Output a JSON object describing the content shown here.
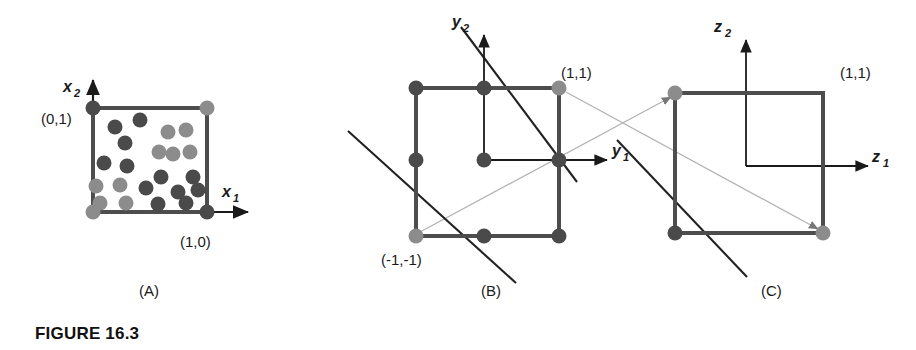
{
  "figure": {
    "caption": "FIGURE 16.3",
    "background_color": "#ffffff",
    "ink_color": "#1a1a1a",
    "square_color": "#4d4d4d",
    "dot_dark_color": "#4a4a4a",
    "dot_light_color": "#8c8c8c",
    "connector_color": "#b3b3b3",
    "thin_line_color": "#555555"
  },
  "panels": [
    {
      "id": "A",
      "label": "(A)",
      "label_x": 139,
      "label_y": 296,
      "axes": {
        "x_axis_label": "x",
        "x_axis_sub": "1",
        "y_axis_label": "x",
        "y_axis_sub": "2",
        "origin_x": 93,
        "origin_y": 212
      },
      "square": {
        "x": 93,
        "y": 108,
        "w": 114,
        "h": 104
      },
      "corner_labels": [
        {
          "text": "(0,1)",
          "x": 41,
          "y": 124
        },
        {
          "text": "(1,0)",
          "x": 180,
          "y": 247
        }
      ],
      "corner_dots": [
        {
          "x": 93,
          "y": 108,
          "shade": "dark"
        },
        {
          "x": 207,
          "y": 108,
          "shade": "light"
        },
        {
          "x": 93,
          "y": 212,
          "shade": "light"
        },
        {
          "x": 207,
          "y": 212,
          "shade": "dark"
        }
      ],
      "scatter_dots": [
        {
          "x": 115,
          "y": 127,
          "shade": "dark"
        },
        {
          "x": 140,
          "y": 120,
          "shade": "dark"
        },
        {
          "x": 168,
          "y": 132,
          "shade": "light"
        },
        {
          "x": 186,
          "y": 130,
          "shade": "light"
        },
        {
          "x": 125,
          "y": 143,
          "shade": "dark"
        },
        {
          "x": 159,
          "y": 152,
          "shade": "light"
        },
        {
          "x": 173,
          "y": 154,
          "shade": "light"
        },
        {
          "x": 190,
          "y": 152,
          "shade": "light"
        },
        {
          "x": 104,
          "y": 163,
          "shade": "dark"
        },
        {
          "x": 127,
          "y": 166,
          "shade": "dark"
        },
        {
          "x": 161,
          "y": 177,
          "shade": "dark"
        },
        {
          "x": 193,
          "y": 177,
          "shade": "dark"
        },
        {
          "x": 96,
          "y": 186,
          "shade": "light"
        },
        {
          "x": 120,
          "y": 185,
          "shade": "light"
        },
        {
          "x": 146,
          "y": 188,
          "shade": "dark"
        },
        {
          "x": 178,
          "y": 192,
          "shade": "dark"
        },
        {
          "x": 198,
          "y": 190,
          "shade": "dark"
        },
        {
          "x": 100,
          "y": 203,
          "shade": "light"
        },
        {
          "x": 126,
          "y": 203,
          "shade": "light"
        },
        {
          "x": 158,
          "y": 204,
          "shade": "dark"
        },
        {
          "x": 186,
          "y": 203,
          "shade": "dark"
        }
      ]
    },
    {
      "id": "B",
      "label": "(B)",
      "label_x": 481,
      "label_y": 296,
      "axes": {
        "x_axis_label": "y",
        "x_axis_sub": "1",
        "y_axis_label": "y",
        "y_axis_sub": "2",
        "origin_x": 484,
        "origin_y": 160
      },
      "square": {
        "x": 416,
        "y": 88,
        "w": 143,
        "h": 148
      },
      "corner_labels": [
        {
          "text": "(1,1)",
          "x": 561,
          "y": 78
        },
        {
          "text": "(-1,-1)",
          "x": 381,
          "y": 265
        }
      ],
      "dots": [
        {
          "x": 416,
          "y": 88,
          "shade": "dark"
        },
        {
          "x": 484,
          "y": 88,
          "shade": "dark"
        },
        {
          "x": 559,
          "y": 88,
          "shade": "light"
        },
        {
          "x": 416,
          "y": 160,
          "shade": "dark"
        },
        {
          "x": 484,
          "y": 160,
          "shade": "dark"
        },
        {
          "x": 559,
          "y": 160,
          "shade": "dark"
        },
        {
          "x": 416,
          "y": 236,
          "shade": "light"
        },
        {
          "x": 484,
          "y": 236,
          "shade": "dark"
        },
        {
          "x": 559,
          "y": 236,
          "shade": "dark"
        }
      ],
      "separator_lines": [
        {
          "x1": 461,
          "y1": 27,
          "x2": 577,
          "y2": 182
        },
        {
          "x1": 348,
          "y1": 131,
          "x2": 516,
          "y2": 283
        }
      ]
    },
    {
      "id": "C",
      "label": "(C)",
      "label_x": 761,
      "label_y": 296,
      "axes": {
        "x_axis_label": "z",
        "x_axis_sub": "1",
        "y_axis_label": "z",
        "y_axis_sub": "2",
        "origin_x": 746,
        "origin_y": 166
      },
      "square": {
        "x": 675,
        "y": 93,
        "w": 148,
        "h": 140
      },
      "corner_labels": [
        {
          "text": "(1,1)",
          "x": 840,
          "y": 78
        }
      ],
      "dots": [
        {
          "x": 675,
          "y": 93,
          "shade": "light"
        },
        {
          "x": 675,
          "y": 233,
          "shade": "dark"
        },
        {
          "x": 823,
          "y": 233,
          "shade": "light"
        }
      ],
      "separator_lines": [
        {
          "x1": 617,
          "y1": 140,
          "x2": 747,
          "y2": 277
        }
      ]
    }
  ],
  "connectors": [
    {
      "name": "b-topright-to-c-bottomright",
      "x1": 566,
      "y1": 92,
      "x2": 818,
      "y2": 229
    },
    {
      "name": "b-bottomleft-to-c-topleft",
      "x1": 420,
      "y1": 232,
      "x2": 671,
      "y2": 97
    }
  ]
}
